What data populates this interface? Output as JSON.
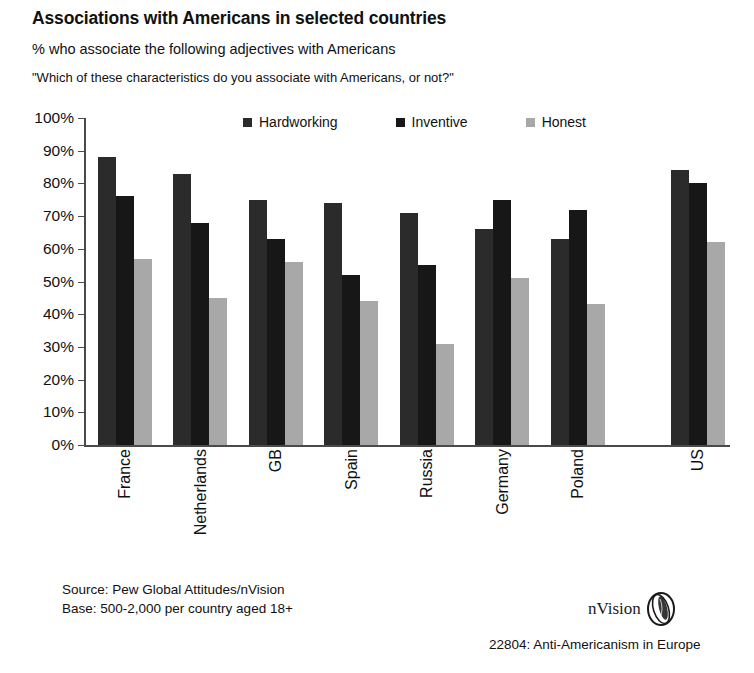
{
  "title": "Associations with Americans in selected countries",
  "subtitle": "% who associate the following adjectives with Americans",
  "question": "\"Which of these characteristics do you associate with Americans, or not?\"",
  "footer": {
    "source_line1": "Source: Pew Global Attitudes/nVision",
    "source_line2": "Base: 500-2,000 per country aged 18+",
    "brand": "nVision",
    "code": "22804: Anti-Americanism in Europe"
  },
  "colors": {
    "hardworking": "#2b2b2b",
    "inventive": "#171717",
    "honest": "#a8a8a8",
    "axis": "#4a4a4a",
    "background": "#ffffff"
  },
  "chart_data": {
    "type": "bar",
    "title": "Associations with Americans in selected countries",
    "subtitle": "% who associate the following adjectives with Americans",
    "annotation": "\"Which of these characteristics do you associate with Americans, or not?\"",
    "xlabel": "",
    "ylabel": "",
    "ylim": [
      0,
      100
    ],
    "yticks": [
      0,
      10,
      20,
      30,
      40,
      50,
      60,
      70,
      80,
      90,
      100
    ],
    "ytick_labels": [
      "0%",
      "10%",
      "20%",
      "30%",
      "40%",
      "50%",
      "60%",
      "70%",
      "80%",
      "90%",
      "100%"
    ],
    "grid": false,
    "legend_position": "top",
    "categories": [
      "France",
      "Netherlands",
      "GB",
      "Spain",
      "Russia",
      "Germany",
      "Poland",
      "US"
    ],
    "series": [
      {
        "name": "Hardworking",
        "color": "#2b2b2b",
        "values": [
          88,
          83,
          75,
          74,
          71,
          66,
          63,
          84
        ]
      },
      {
        "name": "Inventive",
        "color": "#171717",
        "values": [
          76,
          68,
          63,
          52,
          55,
          75,
          72,
          80
        ]
      },
      {
        "name": "Honest",
        "color": "#a8a8a8",
        "values": [
          57,
          45,
          56,
          44,
          31,
          51,
          43,
          62
        ]
      }
    ]
  }
}
